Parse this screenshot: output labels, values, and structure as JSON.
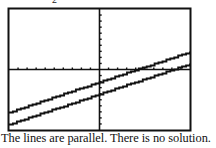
{
  "top_fragment": "2",
  "caption": "The lines are parallel.  There is no solution.",
  "colors": {
    "ink": "#111111",
    "background": "#ffffff"
  },
  "chart_data": {
    "type": "line",
    "title": "",
    "xlabel": "",
    "ylabel": "",
    "xlim": [
      -10,
      10
    ],
    "ylim": [
      -10,
      10
    ],
    "xscale_tick": 1,
    "yscale_tick": 1,
    "grid": false,
    "axes": true,
    "legend": null,
    "series": [
      {
        "name": "line-1",
        "slope": 0.5,
        "intercept": -2,
        "x": [
          -10,
          10
        ],
        "y": [
          -7,
          3
        ]
      },
      {
        "name": "line-2",
        "slope": 0.5,
        "intercept": -4,
        "x": [
          -10,
          10
        ],
        "y": [
          -9,
          1
        ]
      }
    ],
    "annotation": "The lines are parallel.  There is no solution."
  }
}
